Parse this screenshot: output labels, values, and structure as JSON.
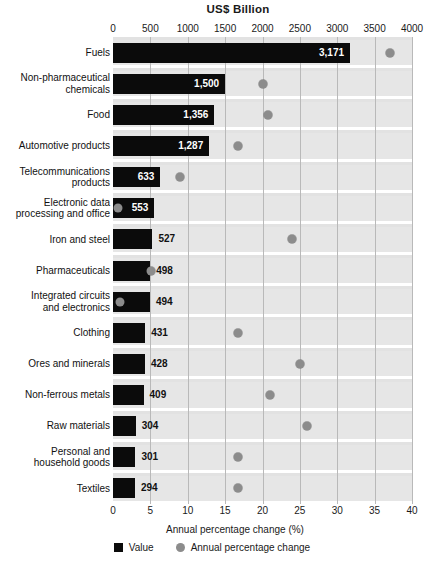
{
  "chart_data": {
    "type": "bar",
    "title": "US$ Billion",
    "xlabel": "",
    "ylabel": "",
    "secondary_xlabel": "Annual percentage change (%)",
    "grid": true,
    "legend_position": "bottom",
    "top_axis": {
      "label": "US$ Billion",
      "min": 0,
      "max": 4000,
      "ticks": [
        "0",
        "500",
        "1000",
        "1500",
        "2000",
        "2500",
        "3000",
        "3500",
        "4000"
      ],
      "tick_values": [
        0,
        500,
        1000,
        1500,
        2000,
        2500,
        3000,
        3500,
        4000
      ]
    },
    "bottom_axis": {
      "label": "Annual percentage change (%)",
      "min": 0,
      "max": 40,
      "ticks": [
        "0",
        "5",
        "10",
        "15",
        "20",
        "25",
        "30",
        "35",
        "40"
      ],
      "tick_values": [
        0,
        5,
        10,
        15,
        20,
        25,
        30,
        35,
        40
      ]
    },
    "categories": [
      "Fuels",
      "Non-pharmaceutical chemicals",
      "Food",
      "Automotive products",
      "Telecommunications products",
      "Electronic data processing and office",
      "Iron and steel",
      "Pharmaceuticals",
      "Integrated circuits and electronics",
      "Clothing",
      "Ores and minerals",
      "Non-ferrous metals",
      "Raw materials",
      "Personal and household goods",
      "Textiles"
    ],
    "series": [
      {
        "name": "Value",
        "axis": "top",
        "unit": "US$ Billion",
        "color": "#0b0b0b",
        "values": [
          3171,
          1500,
          1356,
          1287,
          633,
          553,
          527,
          498,
          494,
          431,
          428,
          409,
          304,
          301,
          294
        ],
        "labels": [
          "3,171",
          "1,500",
          "1,356",
          "1,287",
          "633",
          "553",
          "527",
          "498",
          "494",
          "431",
          "428",
          "409",
          "304",
          "301",
          "294"
        ]
      },
      {
        "name": "Annual percentage change",
        "axis": "bottom",
        "unit": "%",
        "color": "#8c8c8c",
        "values": [
          37.0,
          20.0,
          20.7,
          16.7,
          8.9,
          0.7,
          23.9,
          5.1,
          0.9,
          16.7,
          25.0,
          21.0,
          26.0,
          16.7,
          16.7
        ]
      }
    ]
  },
  "category_lines": [
    [
      "Fuels",
      ""
    ],
    [
      "Non-pharmaceutical",
      "chemicals"
    ],
    [
      "Food",
      ""
    ],
    [
      "Automotive products",
      ""
    ],
    [
      "Telecommunications",
      "products"
    ],
    [
      "Electronic data",
      "processing and office"
    ],
    [
      "Iron and steel",
      ""
    ],
    [
      "Pharmaceuticals",
      ""
    ],
    [
      "Integrated circuits",
      "and electronics"
    ],
    [
      "Clothing",
      ""
    ],
    [
      "Ores and minerals",
      ""
    ],
    [
      "Non-ferrous metals",
      ""
    ],
    [
      "Raw materials",
      ""
    ],
    [
      "Personal and",
      "household goods"
    ],
    [
      "Textiles",
      ""
    ]
  ],
  "legend": {
    "items": [
      {
        "label": "Value",
        "marker": "square",
        "color": "#0b0b0b"
      },
      {
        "label": "Annual percentage change",
        "marker": "circle",
        "color": "#8c8c8c"
      }
    ]
  }
}
